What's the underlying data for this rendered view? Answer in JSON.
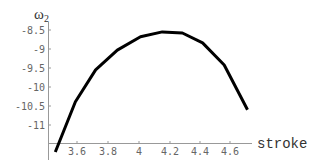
{
  "chart_data": {
    "type": "line",
    "title": "",
    "xlabel": "stroke",
    "ylabel": "ω2",
    "ylabel_main": "ω",
    "ylabel_sub": "2",
    "xlim": [
      3.46,
      4.72
    ],
    "ylim": [
      -11.7,
      -8.4
    ],
    "grid": false,
    "legend": null,
    "x_ticks": [
      "3.6",
      "3.8",
      "4",
      "4.2",
      "4.4",
      "4.6"
    ],
    "y_ticks": [
      "-8.5",
      "-9",
      "-9.5",
      "-10",
      "-10.5",
      "-11"
    ],
    "series": [
      {
        "name": "ω2",
        "color": "#000000",
        "x": [
          3.46,
          3.59,
          3.72,
          3.86,
          4.01,
          4.15,
          4.28,
          4.41,
          4.55,
          4.7
        ],
        "y": [
          -11.71,
          -10.39,
          -9.55,
          -9.03,
          -8.68,
          -8.55,
          -8.58,
          -8.84,
          -9.42,
          -10.6
        ]
      }
    ]
  }
}
